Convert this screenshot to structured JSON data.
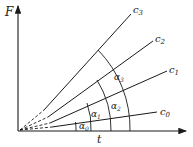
{
  "diagram": {
    "axes": {
      "y_label": "F",
      "x_label": "t"
    },
    "lines": [
      {
        "name": "c0",
        "label": "c",
        "sub": "0"
      },
      {
        "name": "c1",
        "label": "c",
        "sub": "1"
      },
      {
        "name": "c2",
        "label": "c",
        "sub": "2"
      },
      {
        "name": "c3",
        "label": "c",
        "sub": "3"
      }
    ],
    "angles": [
      {
        "label": "α",
        "sub": "0"
      },
      {
        "label": "α",
        "sub": "1"
      },
      {
        "label": "α",
        "sub": "2"
      },
      {
        "label": "α",
        "sub": "3"
      }
    ],
    "colors": {
      "stroke": "#1a1a1a",
      "background": "#ffffff"
    }
  }
}
